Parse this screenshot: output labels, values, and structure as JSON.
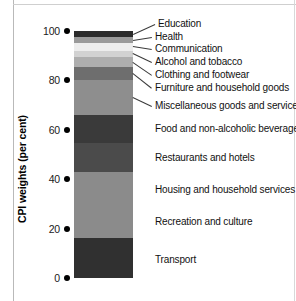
{
  "chart_data": {
    "type": "bar",
    "subtype": "stacked-bar-single-column",
    "title": "",
    "xlabel": "",
    "ylabel": "CPI weights (per cent)",
    "ylim": [
      0,
      100
    ],
    "yticks": [
      0,
      20,
      40,
      60,
      80,
      100
    ],
    "ytick_labels": [
      "0",
      "20",
      "40",
      "60",
      "80",
      "100"
    ],
    "grid": false,
    "legend": "none (direct labels with leader lines at right)",
    "categories": [
      "Transport",
      "Recreation and culture",
      "Housing and household services",
      "Restaurants and hotels",
      "Food and non-alcoholic beverages",
      "Miscellaneous goods and services",
      "Furniture and household goods",
      "Clothing and footwear",
      "Alcohol and tobacco",
      "Communication",
      "Health",
      "Education"
    ],
    "values": [
      16.0,
      13.5,
      13.5,
      11.5,
      11.5,
      14.0,
      5.5,
      4.0,
      2.5,
      3.0,
      2.5,
      2.5
    ],
    "segments": [
      {
        "label": "Education",
        "value": 2.5,
        "cum_top": 100.0,
        "cum_bottom": 97.5,
        "color": "#2b2b2b"
      },
      {
        "label": "Health",
        "value": 2.5,
        "cum_top": 97.5,
        "cum_bottom": 95.0,
        "color": "#9a9a9a"
      },
      {
        "label": "Communication",
        "value": 3.0,
        "cum_top": 95.0,
        "cum_bottom": 92.0,
        "color": "#ededed"
      },
      {
        "label": "Alcohol and tobacco",
        "value": 2.5,
        "cum_top": 92.0,
        "cum_bottom": 89.5,
        "color": "#d2d2d2"
      },
      {
        "label": "Clothing and footwear",
        "value": 4.0,
        "cum_top": 89.5,
        "cum_bottom": 85.5,
        "color": "#aeaeae"
      },
      {
        "label": "Furniture and household goods",
        "value": 5.5,
        "cum_top": 85.5,
        "cum_bottom": 80.0,
        "color": "#6e6e6e"
      },
      {
        "label": "Miscellaneous goods and services",
        "value": 14.0,
        "cum_top": 80.0,
        "cum_bottom": 66.0,
        "color": "#8e8e8e"
      },
      {
        "label": "Food and non-alcoholic beverages",
        "value": 11.5,
        "cum_top": 66.0,
        "cum_bottom": 54.5,
        "color": "#3a3a3a"
      },
      {
        "label": "Restaurants and hotels",
        "value": 11.5,
        "cum_top": 54.5,
        "cum_bottom": 43.0,
        "color": "#4b4b4b"
      },
      {
        "label": "Housing and household services",
        "value": 13.5,
        "cum_top": 43.0,
        "cum_bottom": 29.5,
        "color": "#8b8b8b"
      },
      {
        "label": "Recreation and culture",
        "value": 13.5,
        "cum_top": 29.5,
        "cum_bottom": 16.0,
        "color": "#8b8b8b"
      },
      {
        "label": "Transport",
        "value": 16.0,
        "cum_top": 16.0,
        "cum_bottom": 0.0,
        "color": "#303030"
      }
    ]
  },
  "axis": {
    "title": "CPI weights (per cent)",
    "ticks": [
      {
        "label": "100",
        "value": 100
      },
      {
        "label": "80",
        "value": 80
      },
      {
        "label": "60",
        "value": 60
      },
      {
        "label": "40",
        "value": 40
      },
      {
        "label": "20",
        "value": 20
      },
      {
        "label": "0",
        "value": 0
      }
    ]
  },
  "callouts": [
    {
      "label": "Education",
      "text_y": 24,
      "anchor_y": 34,
      "anchor_x": 133,
      "text_x": 158,
      "leader": true
    },
    {
      "label": "Health",
      "text_y": 37,
      "anchor_y": 40,
      "anchor_x": 133,
      "text_x": 155,
      "leader": true
    },
    {
      "label": "Communication",
      "text_y": 49,
      "anchor_y": 46,
      "anchor_x": 133,
      "text_x": 155,
      "leader": true
    },
    {
      "label": "Alcohol and tobacco",
      "text_y": 62,
      "anchor_y": 53,
      "anchor_x": 133,
      "text_x": 155,
      "leader": true
    },
    {
      "label": "Clothing and footwear",
      "text_y": 75,
      "anchor_y": 62,
      "anchor_x": 133,
      "text_x": 155,
      "leader": true
    },
    {
      "label": "Furniture and household goods",
      "text_y": 88,
      "anchor_y": 73,
      "anchor_x": 133,
      "text_x": 155,
      "leader": true
    },
    {
      "label": "Miscellaneous goods and services",
      "text_y": 106,
      "anchor_y": 97,
      "anchor_x": 133,
      "text_x": 155,
      "leader": true
    },
    {
      "label": "Food and non-alcoholic beverages",
      "text_y": 129,
      "anchor_y": 129,
      "anchor_x": 133,
      "text_x": 155,
      "leader": false
    },
    {
      "label": "Restaurants and hotels",
      "text_y": 158,
      "anchor_y": 158,
      "anchor_x": 133,
      "text_x": 155,
      "leader": false
    },
    {
      "label": "Housing and household services",
      "text_y": 190,
      "anchor_y": 190,
      "anchor_x": 133,
      "text_x": 155,
      "leader": false
    },
    {
      "label": "Recreation and culture",
      "text_y": 222,
      "anchor_y": 222,
      "anchor_x": 133,
      "text_x": 155,
      "leader": false
    },
    {
      "label": "Transport",
      "text_y": 260,
      "anchor_y": 260,
      "anchor_x": 133,
      "text_x": 155,
      "leader": false
    }
  ]
}
